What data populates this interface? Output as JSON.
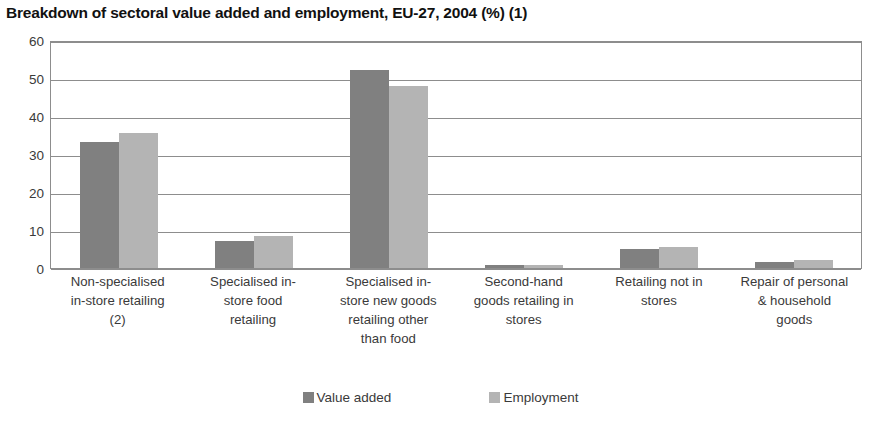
{
  "chart_data": {
    "type": "bar",
    "title": "Breakdown of sectoral value added and employment, EU-27, 2004 (%) (1)",
    "xlabel": "",
    "ylabel": "",
    "ylim": [
      0,
      60
    ],
    "yticks": [
      0,
      10,
      20,
      30,
      40,
      50,
      60
    ],
    "ytick_labels": [
      "0",
      "10",
      "20",
      "30",
      "40",
      "50",
      "60"
    ],
    "grid": true,
    "legend_position": "bottom",
    "categories": [
      "Non-specialised in-store retailing (2)",
      "Specialised in-store food retailing",
      "Specialised in-store new goods retailing other than food",
      "Second-hand goods retailing in stores",
      "Retailing not in stores",
      "Repair of personal & household goods"
    ],
    "category_lines": [
      [
        "Non-specialised",
        "in-store retailing",
        "(2)"
      ],
      [
        "Specialised in-",
        "store food",
        "retailing"
      ],
      [
        "Specialised in-",
        "store new goods",
        "retailing other",
        "than food"
      ],
      [
        "Second-hand",
        "goods retailing in",
        "stores"
      ],
      [
        "Retailing not in",
        "stores"
      ],
      [
        "Repair of personal",
        "& household",
        "goods"
      ]
    ],
    "series": [
      {
        "name": "Value added",
        "color": "#808080",
        "values": [
          33.2,
          7.0,
          52.0,
          0.8,
          5.0,
          1.5
        ]
      },
      {
        "name": "Employment",
        "color": "#b4b4b4",
        "values": [
          35.5,
          8.5,
          48.0,
          0.9,
          5.5,
          2.0
        ]
      }
    ]
  }
}
